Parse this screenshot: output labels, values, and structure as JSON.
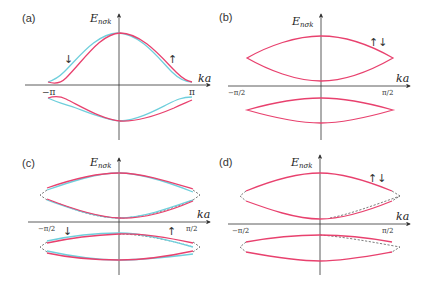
{
  "panels": [
    {
      "id": "a",
      "label": "(a)",
      "ylabel": "E",
      "ylabel_sub": "nσk",
      "xlabel": "ka",
      "tick_left": "−π",
      "tick_right": "π",
      "spin_left": "↓",
      "spin_right": "↑"
    },
    {
      "id": "b",
      "label": "(b)",
      "ylabel": "E",
      "ylabel_sub": "nσk",
      "xlabel": "ka",
      "tick_left": "−π/2",
      "tick_right": "π/2",
      "spin": "↑↓"
    },
    {
      "id": "c",
      "label": "(c)",
      "ylabel": "E",
      "ylabel_sub": "nσk",
      "xlabel": "ka",
      "tick_left": "−π/2",
      "tick_right": "π/2",
      "spin_left": "↓",
      "spin_right": "↑"
    },
    {
      "id": "d",
      "label": "(d)",
      "ylabel": "E",
      "ylabel_sub": "nσk",
      "xlabel": "ka",
      "tick_left": "−π/2",
      "tick_right": "π/2",
      "spin": "↑↓"
    }
  ],
  "colors": {
    "spin_up": "#e8416e",
    "spin_down": "#6fcfdc",
    "axis": "#333333",
    "dashed": "#444444"
  }
}
